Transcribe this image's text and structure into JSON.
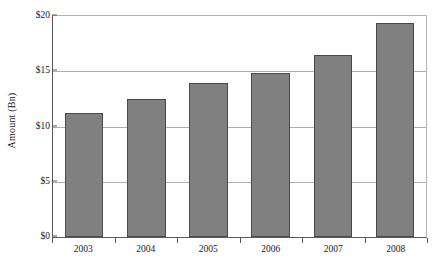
{
  "chart_data": {
    "type": "bar",
    "title": "",
    "subtitle": "",
    "xlabel": "",
    "ylabel": "Amount (Bn)",
    "categories": [
      "2003",
      "2004",
      "2005",
      "2006",
      "2007",
      "2008"
    ],
    "values": [
      11.2,
      12.5,
      13.9,
      14.8,
      16.5,
      19.4
    ],
    "series": [
      {
        "name": "Amount",
        "values": [
          11.2,
          12.5,
          13.9,
          14.8,
          16.5,
          19.4
        ]
      }
    ],
    "ylim": [
      0,
      20
    ],
    "y_ticks": [
      0,
      5,
      10,
      15,
      20
    ],
    "y_tick_labels": [
      "$0",
      "$5",
      "$10",
      "$15",
      "$20"
    ],
    "grid": "horizontal",
    "legend": "none",
    "bar_color": "#808080",
    "bar_border_color": "#4a4a4a",
    "gridline_color": "#b0b0b0",
    "axis_color": "#5a5a5a",
    "background_color": "#ffffff"
  }
}
